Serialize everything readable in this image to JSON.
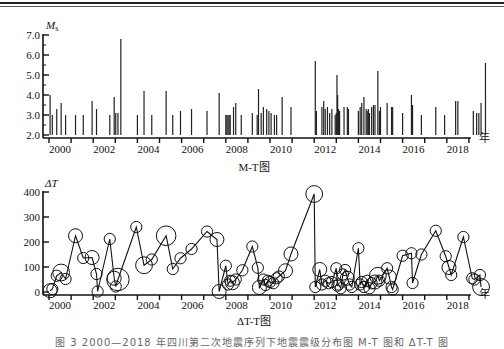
{
  "chart_data": [
    {
      "type": "bar",
      "title": "M-T图",
      "ylabel": "Ms",
      "xlabel": "年",
      "ylim": [
        2.0,
        7.0
      ],
      "yticks": [
        "2.0",
        "3.0",
        "4.0",
        "5.0",
        "6.0",
        "7.0"
      ],
      "xticks": [
        "2000",
        "2002",
        "2004",
        "2006",
        "2008",
        "2010",
        "2012",
        "2014",
        "2016",
        "2018"
      ],
      "bars": [
        [
          2000.05,
          4.0
        ],
        [
          2000.15,
          3.0
        ],
        [
          2000.35,
          3.3
        ],
        [
          2000.55,
          3.6
        ],
        [
          2000.75,
          3.0
        ],
        [
          2001.2,
          3.0
        ],
        [
          2001.55,
          3.0
        ],
        [
          2001.95,
          3.7
        ],
        [
          2002.15,
          3.3
        ],
        [
          2002.75,
          3.0
        ],
        [
          2002.95,
          3.9
        ],
        [
          2003.02,
          3.1
        ],
        [
          2003.12,
          3.1
        ],
        [
          2003.25,
          6.8
        ],
        [
          2004.0,
          3.0
        ],
        [
          2004.3,
          4.2
        ],
        [
          2004.65,
          3.0
        ],
        [
          2005.3,
          4.2
        ],
        [
          2005.6,
          3.0
        ],
        [
          2005.95,
          3.2
        ],
        [
          2006.45,
          3.3
        ],
        [
          2007.15,
          3.2
        ],
        [
          2007.7,
          4.1
        ],
        [
          2008.0,
          3.0
        ],
        [
          2008.05,
          3.0
        ],
        [
          2008.1,
          3.0
        ],
        [
          2008.15,
          3.0
        ],
        [
          2008.2,
          3.0
        ],
        [
          2008.35,
          3.4
        ],
        [
          2008.45,
          3.6
        ],
        [
          2008.7,
          3.0
        ],
        [
          2009.2,
          3.1
        ],
        [
          2009.42,
          3.0
        ],
        [
          2009.48,
          4.3
        ],
        [
          2009.6,
          3.1
        ],
        [
          2009.7,
          3.4
        ],
        [
          2009.85,
          3.3
        ],
        [
          2009.95,
          3.2
        ],
        [
          2010.05,
          3.1
        ],
        [
          2010.2,
          3.0
        ],
        [
          2010.3,
          3.0
        ],
        [
          2010.55,
          3.9
        ],
        [
          2010.95,
          3.4
        ],
        [
          2012.05,
          5.7
        ],
        [
          2012.1,
          3.2
        ],
        [
          2012.35,
          3.4
        ],
        [
          2012.43,
          3.7
        ],
        [
          2012.5,
          3.3
        ],
        [
          2012.6,
          3.4
        ],
        [
          2012.7,
          3.1
        ],
        [
          2012.8,
          3.3
        ],
        [
          2012.95,
          3.0
        ],
        [
          2013.0,
          3.1
        ],
        [
          2013.03,
          5.0
        ],
        [
          2013.06,
          4.0
        ],
        [
          2013.1,
          3.3
        ],
        [
          2013.15,
          3.2
        ],
        [
          2013.35,
          3.4
        ],
        [
          2013.5,
          3.4
        ],
        [
          2013.55,
          3.3
        ],
        [
          2014.0,
          3.2
        ],
        [
          2014.08,
          3.4
        ],
        [
          2014.15,
          3.6
        ],
        [
          2014.25,
          3.9
        ],
        [
          2014.35,
          3.3
        ],
        [
          2014.4,
          3.2
        ],
        [
          2014.45,
          3.3
        ],
        [
          2014.5,
          3.1
        ],
        [
          2014.6,
          3.4
        ],
        [
          2014.68,
          3.5
        ],
        [
          2014.75,
          3.5
        ],
        [
          2014.88,
          5.2
        ],
        [
          2014.95,
          3.2
        ],
        [
          2015.0,
          3.4
        ],
        [
          2015.3,
          3.6
        ],
        [
          2015.5,
          3.4
        ],
        [
          2015.55,
          3.4
        ],
        [
          2016.0,
          3.1
        ],
        [
          2016.4,
          4.0
        ],
        [
          2016.45,
          3.5
        ],
        [
          2016.85,
          3.0
        ],
        [
          2017.5,
          3.4
        ],
        [
          2017.9,
          3.0
        ],
        [
          2018.4,
          3.7
        ],
        [
          2018.5,
          3.7
        ],
        [
          2019.2,
          3.2
        ],
        [
          2019.35,
          3.1
        ],
        [
          2019.45,
          3.1
        ],
        [
          2019.55,
          3.6
        ],
        [
          2019.75,
          5.6
        ]
      ]
    },
    {
      "type": "line",
      "title": "ΔT-T图",
      "ylabel": "ΔT",
      "xlabel": "年",
      "ylim": [
        0,
        400
      ],
      "yticks": [
        "0",
        "100",
        "200",
        "300",
        "400"
      ],
      "xticks": [
        "2000",
        "2002",
        "2004",
        "2006",
        "2008",
        "2010",
        "2012",
        "2014",
        "2016",
        "2018"
      ],
      "points": [
        [
          2000.05,
          5,
          5
        ],
        [
          2000.15,
          12,
          4
        ],
        [
          2000.35,
          65,
          4
        ],
        [
          2000.55,
          78,
          6
        ],
        [
          2000.75,
          52,
          4
        ],
        [
          2001.2,
          225,
          5
        ],
        [
          2001.55,
          136,
          4
        ],
        [
          2001.95,
          138,
          5
        ],
        [
          2002.15,
          72,
          4
        ],
        [
          2002.2,
          2,
          4
        ],
        [
          2002.75,
          212,
          4
        ],
        [
          2002.95,
          55,
          5
        ],
        [
          2003.02,
          22,
          4
        ],
        [
          2003.12,
          50,
          8
        ],
        [
          2003.95,
          260,
          4
        ],
        [
          2004.3,
          107,
          6
        ],
        [
          2004.65,
          130,
          4
        ],
        [
          2005.3,
          225,
          7
        ],
        [
          2005.6,
          92,
          4
        ],
        [
          2005.95,
          135,
          4
        ],
        [
          2006.45,
          172,
          4
        ],
        [
          2007.15,
          242,
          4
        ],
        [
          2007.6,
          210,
          5
        ],
        [
          2007.7,
          2,
          5
        ],
        [
          2008.0,
          105,
          4
        ],
        [
          2008.1,
          30,
          4
        ],
        [
          2008.2,
          45,
          4
        ],
        [
          2008.3,
          37,
          5
        ],
        [
          2008.45,
          50,
          4
        ],
        [
          2008.75,
          87,
          4
        ],
        [
          2009.2,
          182,
          4
        ],
        [
          2009.45,
          97,
          4
        ],
        [
          2009.52,
          18,
          5
        ],
        [
          2009.7,
          50,
          4
        ],
        [
          2009.8,
          28,
          4
        ],
        [
          2009.9,
          45,
          4
        ],
        [
          2010.0,
          40,
          4
        ],
        [
          2010.15,
          35,
          4
        ],
        [
          2010.3,
          55,
          4
        ],
        [
          2010.4,
          62,
          4
        ],
        [
          2010.7,
          85,
          5
        ],
        [
          2010.95,
          152,
          5
        ],
        [
          2012.0,
          392,
          6
        ],
        [
          2012.05,
          20,
          4
        ],
        [
          2012.25,
          90,
          5
        ],
        [
          2012.35,
          30,
          4
        ],
        [
          2012.5,
          45,
          4
        ],
        [
          2012.65,
          35,
          4
        ],
        [
          2012.8,
          40,
          4
        ],
        [
          2013.0,
          95,
          4
        ],
        [
          2013.05,
          25,
          4
        ],
        [
          2013.1,
          30,
          4
        ],
        [
          2013.2,
          15,
          4
        ],
        [
          2013.3,
          70,
          4
        ],
        [
          2013.4,
          88,
          4
        ],
        [
          2013.5,
          55,
          5
        ],
        [
          2013.6,
          30,
          4
        ],
        [
          2013.7,
          20,
          4
        ],
        [
          2014.0,
          175,
          4
        ],
        [
          2014.08,
          30,
          4
        ],
        [
          2014.15,
          40,
          4
        ],
        [
          2014.25,
          20,
          4
        ],
        [
          2014.4,
          45,
          4
        ],
        [
          2014.5,
          15,
          4
        ],
        [
          2014.6,
          35,
          4
        ],
        [
          2014.75,
          40,
          5
        ],
        [
          2014.88,
          65,
          6
        ],
        [
          2014.95,
          45,
          4
        ],
        [
          2015.3,
          95,
          4
        ],
        [
          2015.4,
          60,
          5
        ],
        [
          2015.5,
          20,
          4
        ],
        [
          2015.55,
          10,
          4
        ],
        [
          2016.0,
          145,
          4
        ],
        [
          2016.4,
          155,
          4
        ],
        [
          2016.45,
          36,
          4
        ],
        [
          2016.85,
          150,
          4
        ],
        [
          2017.5,
          245,
          4
        ],
        [
          2017.95,
          143,
          4
        ],
        [
          2018.1,
          98,
          5
        ],
        [
          2018.2,
          68,
          4
        ],
        [
          2018.75,
          220,
          4
        ],
        [
          2019.15,
          55,
          4
        ],
        [
          2019.25,
          50,
          4
        ],
        [
          2019.5,
          68,
          4
        ],
        [
          2019.55,
          20,
          6
        ]
      ]
    }
  ],
  "labels": {
    "ms_axis": "M",
    "ms_sub": "s",
    "dt_axis": "ΔT",
    "year_unit": "年",
    "mt_title": "M-T图",
    "dt_title": "ΔT-T图",
    "caption": "图 3  2000—2018 年四川第二次地震序列下地震震级分布图 M-T 图和 ΔT-T 图"
  }
}
